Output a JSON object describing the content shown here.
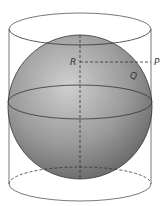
{
  "figure": {
    "labels": {
      "R": "R",
      "P": "P",
      "Q": "Q"
    },
    "colors": {
      "line": "#444444",
      "sphere_light": "#c8c8c8",
      "sphere_dark": "#5a5a5a",
      "background": "#ffffff"
    }
  }
}
